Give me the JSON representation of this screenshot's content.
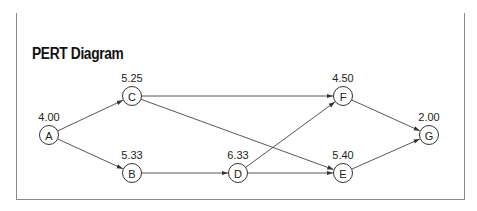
{
  "title": "PERT Diagram",
  "colors": {
    "header_bar": "#1a1a1a",
    "border": "#8a8a8a",
    "line": "#444444",
    "text": "#222222"
  },
  "nodes": [
    {
      "id": "A",
      "value": "4.00",
      "x": 49,
      "y": 135
    },
    {
      "id": "B",
      "value": "5.33",
      "x": 132,
      "y": 173
    },
    {
      "id": "C",
      "value": "5.25",
      "x": 132,
      "y": 96
    },
    {
      "id": "D",
      "value": "6.33",
      "x": 238,
      "y": 173
    },
    {
      "id": "E",
      "value": "5.40",
      "x": 343,
      "y": 173
    },
    {
      "id": "F",
      "value": "4.50",
      "x": 343,
      "y": 96
    },
    {
      "id": "G",
      "value": "2.00",
      "x": 429,
      "y": 135
    }
  ],
  "edges": [
    {
      "from": "A",
      "to": "C"
    },
    {
      "from": "A",
      "to": "B"
    },
    {
      "from": "C",
      "to": "F"
    },
    {
      "from": "C",
      "to": "E"
    },
    {
      "from": "B",
      "to": "D"
    },
    {
      "from": "D",
      "to": "F"
    },
    {
      "from": "D",
      "to": "E"
    },
    {
      "from": "F",
      "to": "G"
    },
    {
      "from": "E",
      "to": "G"
    }
  ]
}
